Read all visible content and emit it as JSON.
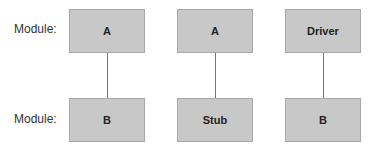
{
  "rows": {
    "top_label": "Module:",
    "bottom_label": "Module:"
  },
  "columns": [
    {
      "top": "A",
      "bottom": "B"
    },
    {
      "top": "A",
      "bottom": "Stub"
    },
    {
      "top": "Driver",
      "bottom": "B"
    }
  ],
  "colors": {
    "box_fill": "#c8c8c8",
    "connector": "#777777"
  }
}
